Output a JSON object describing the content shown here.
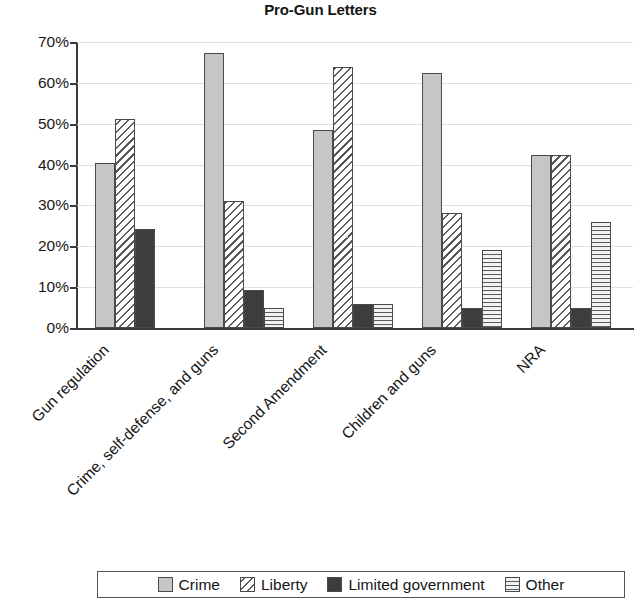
{
  "chart_data": {
    "type": "bar",
    "title": "Pro-Gun Letters",
    "xlabel": "",
    "ylabel": "",
    "ylim": [
      0,
      70
    ],
    "ytick_labels": [
      "0%",
      "10%",
      "20%",
      "30%",
      "40%",
      "50%",
      "60%",
      "70%"
    ],
    "ytick_values": [
      0,
      10,
      20,
      30,
      40,
      50,
      60,
      70
    ],
    "grid": true,
    "legend_position": "bottom",
    "value_suffix": "%",
    "categories": [
      "Gun regulation",
      "Crime, self-defense, and guns",
      "Second Amendment",
      "Children and guns",
      "NRA"
    ],
    "series": [
      {
        "name": "Crime",
        "pattern": "solid-light-gray",
        "values": [
          40.4,
          67.2,
          48.4,
          62.4,
          42.3
        ]
      },
      {
        "name": "Liberty",
        "pattern": "diagonal-hatch",
        "values": [
          51.2,
          31.0,
          64.0,
          28.2,
          42.3
        ]
      },
      {
        "name": "Limited government",
        "pattern": "solid-dark-gray",
        "values": [
          24.2,
          9.2,
          6.0,
          5.0,
          5.0
        ]
      },
      {
        "name": "Other",
        "pattern": "horizontal-stripes",
        "values": [
          0.0,
          4.8,
          6.0,
          19.1,
          26.0
        ]
      }
    ]
  },
  "colors": {
    "crime": "#c6c6c6",
    "liberty": "#ffffff",
    "limited_government": "#3d3d3d",
    "other": "#f2f2f2",
    "axis": "#3a3a3a",
    "gridline": "#dfdfdf",
    "text": "#151515"
  },
  "legend": {
    "entries": [
      {
        "label": "Crime"
      },
      {
        "label": "Liberty"
      },
      {
        "label": "Limited government"
      },
      {
        "label": "Other"
      }
    ]
  }
}
